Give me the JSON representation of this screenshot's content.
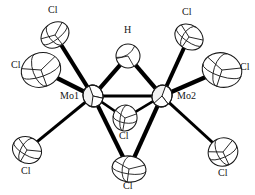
{
  "figure": {
    "type": "ortep-thermal-ellipsoid-plot",
    "title": "",
    "width": 255,
    "height": 195,
    "background_color": "#ffffff",
    "bond_color": "#000000",
    "ellipsoid_outline_color": "#1a1a1a",
    "ellipsoid_fill_color": "#ffffff",
    "label_color": "#151515"
  },
  "labels": {
    "mo1": "Mo1",
    "mo2": "Mo2",
    "h_bridge": "H",
    "cl_upper_left": "Cl",
    "cl_mid_left": "Cl",
    "cl_lower_left": "Cl",
    "cl_bridge_inner": "Cl",
    "cl_bridge_bottom": "Cl",
    "cl_upper_right": "Cl",
    "cl_mid_right": "Cl",
    "cl_lower_right": "Cl"
  },
  "atoms": [
    {
      "id": "Mo1",
      "element": "Mo",
      "label": "Mo1",
      "x": 93,
      "y": 96,
      "rx": 10,
      "ry": 11,
      "rot": -20,
      "filled": true,
      "label_x": 60,
      "label_y": 92,
      "label_align": "right"
    },
    {
      "id": "Mo2",
      "element": "Mo",
      "label": "Mo2",
      "x": 162,
      "y": 96,
      "rx": 10,
      "ry": 11,
      "rot": 20,
      "filled": true,
      "label_x": 177,
      "label_y": 92,
      "label_align": "left"
    },
    {
      "id": "H1",
      "element": "H",
      "label": "H",
      "x": 128,
      "y": 56,
      "rx": 12,
      "ry": 12,
      "rot": 0,
      "filled": false,
      "label_x": 124,
      "label_y": 26,
      "label_align": "left"
    },
    {
      "id": "Cl1",
      "element": "Cl",
      "label": "Cl",
      "x": 55,
      "y": 35,
      "rx": 15,
      "ry": 12,
      "rot": -38,
      "filled": false,
      "label_x": 48,
      "label_y": 6,
      "label_align": "left"
    },
    {
      "id": "Cl2",
      "element": "Cl",
      "label": "Cl",
      "x": 41,
      "y": 70,
      "rx": 20,
      "ry": 17,
      "rot": -20,
      "filled": false,
      "label_x": 11,
      "label_y": 61,
      "label_align": "left"
    },
    {
      "id": "Cl3",
      "element": "Cl",
      "label": "Cl",
      "x": 27,
      "y": 150,
      "rx": 15,
      "ry": 13,
      "rot": 30,
      "filled": false,
      "label_x": 21,
      "label_y": 166,
      "label_align": "left"
    },
    {
      "id": "Cl4",
      "element": "Cl",
      "label": "Cl",
      "x": 125,
      "y": 118,
      "rx": 12,
      "ry": 13,
      "rot": 10,
      "filled": false,
      "label_x": 120,
      "label_y": 131,
      "label_align": "left"
    },
    {
      "id": "Cl5",
      "element": "Cl",
      "label": "Cl",
      "x": 129,
      "y": 169,
      "rx": 17,
      "ry": 13,
      "rot": 8,
      "filled": false,
      "label_x": 123,
      "label_y": 180,
      "label_align": "left"
    },
    {
      "id": "Cl6",
      "element": "Cl",
      "label": "Cl",
      "x": 189,
      "y": 37,
      "rx": 15,
      "ry": 12,
      "rot": 35,
      "filled": false,
      "label_x": 182,
      "label_y": 8,
      "label_align": "left"
    },
    {
      "id": "Cl7",
      "element": "Cl",
      "label": "Cl",
      "x": 222,
      "y": 70,
      "rx": 20,
      "ry": 17,
      "rot": 18,
      "filled": false,
      "label_x": 240,
      "label_y": 63,
      "label_align": "left"
    },
    {
      "id": "Cl8",
      "element": "Cl",
      "label": "Cl",
      "x": 223,
      "y": 152,
      "rx": 15,
      "ry": 14,
      "rot": -25,
      "filled": false,
      "label_x": 218,
      "label_y": 168,
      "label_align": "left"
    }
  ],
  "bonds": [
    {
      "from": "Mo1",
      "to": "Mo2",
      "width": 3.2,
      "kind": "metal-metal"
    },
    {
      "from": "Mo1",
      "to": "H1",
      "width": 4.2,
      "kind": "bridge"
    },
    {
      "from": "Mo2",
      "to": "H1",
      "width": 4.2,
      "kind": "bridge"
    },
    {
      "from": "Mo1",
      "to": "Cl4",
      "width": 2.6,
      "kind": "bridge"
    },
    {
      "from": "Mo2",
      "to": "Cl4",
      "width": 2.6,
      "kind": "bridge"
    },
    {
      "from": "Mo1",
      "to": "Cl5",
      "width": 4.2,
      "kind": "bridge"
    },
    {
      "from": "Mo2",
      "to": "Cl5",
      "width": 4.2,
      "kind": "bridge"
    },
    {
      "from": "Mo1",
      "to": "Cl1",
      "width": 4.0,
      "kind": "terminal"
    },
    {
      "from": "Mo1",
      "to": "Cl2",
      "width": 4.4,
      "kind": "terminal"
    },
    {
      "from": "Mo1",
      "to": "Cl3",
      "width": 3.0,
      "kind": "terminal"
    },
    {
      "from": "Mo2",
      "to": "Cl6",
      "width": 4.0,
      "kind": "terminal"
    },
    {
      "from": "Mo2",
      "to": "Cl7",
      "width": 4.4,
      "kind": "terminal"
    },
    {
      "from": "Mo2",
      "to": "Cl8",
      "width": 3.0,
      "kind": "terminal"
    }
  ]
}
